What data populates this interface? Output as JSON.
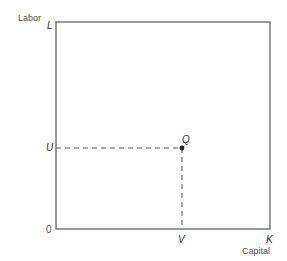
{
  "diagram": {
    "y_axis_title": "Labor",
    "x_axis_title": "Capital",
    "y_top_label": "L",
    "x_right_label": "K",
    "origin_label": "0",
    "point": {
      "label": "Q",
      "x_label": "V",
      "y_label": "U"
    },
    "colors": {
      "box": "#666666",
      "dash": "#555555",
      "point": "#222222"
    }
  }
}
